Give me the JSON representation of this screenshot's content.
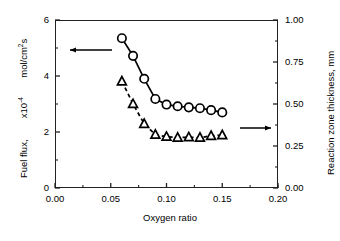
{
  "chart_data": {
    "type": "line",
    "title": "",
    "xlabel": "Oxygen ratio",
    "ylabel": "Fuel flux,    x10-4    mol/cm2s",
    "ylabel_right": "Reaction zone thickness, mm",
    "xlim": [
      0.0,
      0.2
    ],
    "ylim": [
      0,
      6
    ],
    "ylim_right": [
      0.0,
      1.0
    ],
    "xticks": [
      "0.00",
      "0.05",
      "0.10",
      "0.15",
      "0.20"
    ],
    "xtick_values": [
      0.0,
      0.05,
      0.1,
      0.15,
      0.2
    ],
    "yticks": [
      "0",
      "2",
      "4",
      "6"
    ],
    "ytick_values": [
      0,
      2,
      4,
      6
    ],
    "yticks_right": [
      "0.00",
      "0.25",
      "0.50",
      "0.75",
      "1.00"
    ],
    "ytick_values_right": [
      0.0,
      0.25,
      0.5,
      0.75,
      1.0
    ],
    "minor_ticks": true,
    "grid": false,
    "legend": "none",
    "annotations": [
      {
        "name": "left-axis-arrow",
        "text": "←",
        "points_to": "left-y-axis",
        "x": 0.05,
        "y_axis": "left",
        "y": 4.55
      },
      {
        "name": "right-axis-arrow",
        "text": "→",
        "points_to": "right-y-axis",
        "x": 0.158,
        "y_axis": "right",
        "y": 0.305
      }
    ],
    "series": [
      {
        "name": "Fuel flux",
        "axis": "left",
        "marker": "circle-open",
        "linestyle": "solid",
        "color": "#000000",
        "x": [
          0.06,
          0.07,
          0.08,
          0.09,
          0.1,
          0.11,
          0.12,
          0.13,
          0.14,
          0.15
        ],
        "values": [
          5.35,
          4.72,
          3.9,
          3.18,
          2.98,
          2.92,
          2.88,
          2.85,
          2.78,
          2.7
        ]
      },
      {
        "name": "Reaction zone thickness",
        "axis": "right",
        "marker": "triangle-open",
        "linestyle": "dashed",
        "color": "#000000",
        "x": [
          0.06,
          0.07,
          0.08,
          0.09,
          0.1,
          0.11,
          0.12,
          0.13,
          0.14,
          0.15
        ],
        "values": [
          0.635,
          0.5,
          0.382,
          0.318,
          0.305,
          0.3,
          0.302,
          0.3,
          0.31,
          0.315
        ]
      }
    ]
  },
  "axis_titles": {
    "x": "Oxygen ratio",
    "y_left_part1": "Fuel flux,",
    "y_left_part2": "x10",
    "y_left_exp": "-4",
    "y_left_part3": "mol/cm",
    "y_left_exp2": "2",
    "y_left_part4": "s",
    "y_right": "Reaction zone thickness, mm"
  },
  "ticks": {
    "x": [
      "0.00",
      "0.05",
      "0.10",
      "0.15",
      "0.20"
    ],
    "y_left": [
      "6",
      "4",
      "2",
      "0"
    ],
    "y_right": [
      "1.00",
      "0.75",
      "0.50",
      "0.25",
      "0.00"
    ]
  }
}
